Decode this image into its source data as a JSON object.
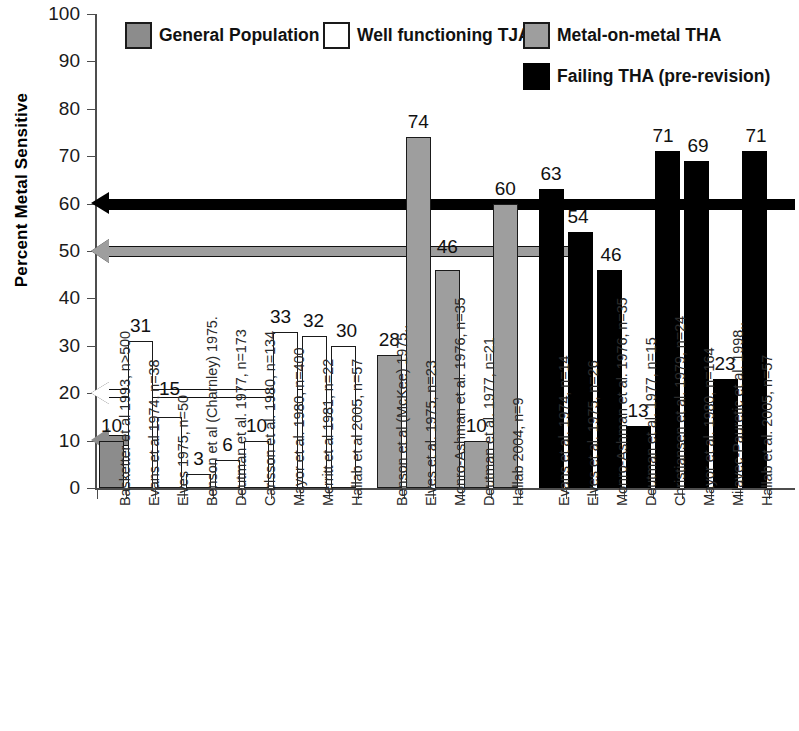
{
  "chart_data": {
    "type": "bar",
    "title": "",
    "xlabel": "",
    "ylabel": "Percent Metal Sensitive",
    "ylim": [
      0,
      100
    ],
    "ytick_labels": [
      "100",
      "90",
      "80",
      "70",
      "60",
      "50",
      "40",
      "30",
      "20",
      "10",
      "0"
    ],
    "ytick_values": [
      100,
      90,
      80,
      70,
      60,
      50,
      40,
      30,
      20,
      10,
      0
    ],
    "grid": false,
    "legend_position": "top",
    "legend": [
      {
        "label": "General Population",
        "swatch": "gray",
        "color": "#8c8c8c"
      },
      {
        "label": "Well functioning TJA's",
        "swatch": "white",
        "color": "#ffffff"
      },
      {
        "label": "Metal-on-metal THA",
        "swatch": "lgray",
        "color": "#9e9e9e"
      },
      {
        "label": "Failing THA (pre-revision)",
        "swatch": "black",
        "color": "#000000"
      }
    ],
    "reference_arrows": [
      {
        "name": "failing-tha-average",
        "value": 60,
        "style": "black",
        "color": "#000000"
      },
      {
        "name": "metal-on-metal-average",
        "value": 50,
        "style": "lgray",
        "color": "#9e9e9e"
      },
      {
        "name": "well-functioning-tja-average",
        "value": 20,
        "style": "white",
        "color": "#ffffff"
      },
      {
        "name": "general-population-average",
        "value": 10,
        "style": "gray",
        "color": "#8c8c8c"
      }
    ],
    "groups": [
      {
        "name": "General Population",
        "series": "gray",
        "categories": [
          "Basketter et al 1993, n>500"
        ],
        "values": [
          10
        ]
      },
      {
        "name": "Well functioning TJA's",
        "series": "white",
        "categories": [
          "Evans et al 1974, n=38",
          "Elves 1975, n=50",
          "Benson et al (Charnley) 1975.",
          "Deutman et al. 1977, n=173",
          "Carlsson et al. 1980, n=134",
          "Mayor et al. 1980, n=400",
          "Merritt et al 1981, n=22",
          "Hallab et al 2005, n=57"
        ],
        "values": [
          31,
          15,
          3,
          6,
          10,
          33,
          32,
          30
        ]
      },
      {
        "name": "Metal-on-metal THA",
        "series": "lgray",
        "categories": [
          "Benson et al (McKee) 1975..",
          "Elves et al. 1975, n=23",
          "Monro-Ashman et al. 1976, n=35",
          "Deutman et al. 1977, n=21",
          "Hallab 2004, n=9"
        ],
        "values": [
          28,
          74,
          46,
          10,
          60
        ]
      },
      {
        "name": "Failing THA (pre-revision)",
        "series": "black",
        "categories": [
          "Evans et al. 1974, n=14",
          "Elves et al. 1975, n=26",
          "Monro-Ashman et al. 1976, n=35",
          "Deutman et al. 1977, n=15",
          "Christiansen et al. 1979, n=24",
          "Mayor et al. 1980, n=164",
          "Milavec-Pauretic et al. 1998..",
          "Hallab et al. 2005, n=57"
        ],
        "values": [
          63,
          54,
          46,
          13,
          71,
          69,
          23,
          71
        ]
      }
    ],
    "bars": [
      {
        "category": "Basketter et al 1993, n>500",
        "value": 10,
        "series": "gray"
      },
      {
        "category": "Evans et al 1974, n=38",
        "value": 31,
        "series": "white"
      },
      {
        "category": "Elves 1975, n=50",
        "value": 15,
        "series": "white"
      },
      {
        "category": "Benson et al (Charnley) 1975.",
        "value": 3,
        "series": "white"
      },
      {
        "category": "Deutman et al. 1977, n=173",
        "value": 6,
        "series": "white"
      },
      {
        "category": "Carlsson et al. 1980, n=134",
        "value": 10,
        "series": "white"
      },
      {
        "category": "Mayor et al. 1980, n=400",
        "value": 33,
        "series": "white"
      },
      {
        "category": "Merritt et al 1981, n=22",
        "value": 32,
        "series": "white"
      },
      {
        "category": "Hallab et al 2005, n=57",
        "value": 30,
        "series": "white"
      },
      {
        "category": "Benson et al (McKee) 1975..",
        "value": 28,
        "series": "lgray"
      },
      {
        "category": "Elves et al. 1975, n=23",
        "value": 74,
        "series": "lgray"
      },
      {
        "category": "Monro-Ashman et al. 1976, n=35",
        "value": 46,
        "series": "lgray"
      },
      {
        "category": "Deutman et al. 1977, n=21",
        "value": 10,
        "series": "lgray"
      },
      {
        "category": "Hallab 2004, n=9",
        "value": 60,
        "series": "lgray"
      },
      {
        "category": "Evans et al. 1974, n=14",
        "value": 63,
        "series": "black"
      },
      {
        "category": "Elves et al. 1975, n=26",
        "value": 54,
        "series": "black"
      },
      {
        "category": "Monro-Ashman et al. 1976, n=35 ",
        "value": 46,
        "series": "black"
      },
      {
        "category": "Deutman et al. 1977, n=15",
        "value": 13,
        "series": "black"
      },
      {
        "category": "Christiansen et al. 1979, n=24",
        "value": 71,
        "series": "black"
      },
      {
        "category": "Mayor et al. 1980, n=164",
        "value": 69,
        "series": "black"
      },
      {
        "category": "Milavec-Pauretic et al. 1998..",
        "value": 23,
        "series": "black"
      },
      {
        "category": "Hallab et al. 2005, n=57",
        "value": 71,
        "series": "black"
      }
    ]
  }
}
